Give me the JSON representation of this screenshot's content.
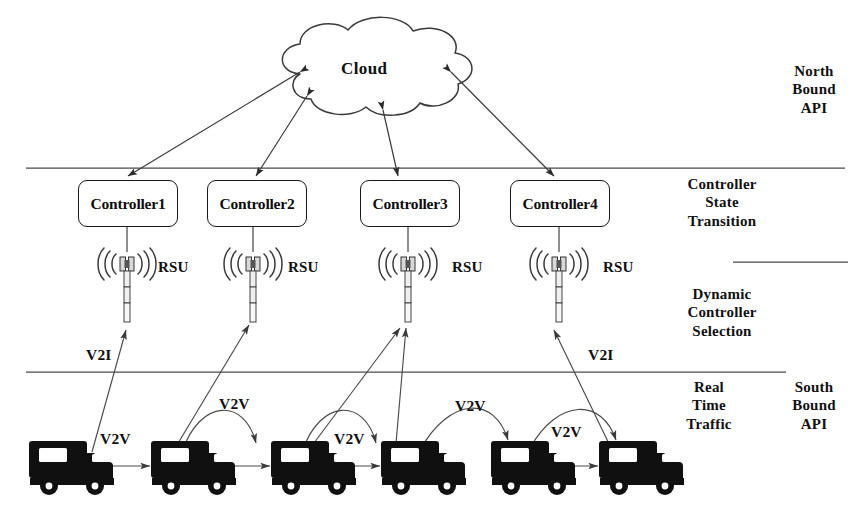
{
  "diagram": {
    "background": "#ffffff",
    "stroke": "#2b2b2b",
    "vehicle_fill": "#101010"
  },
  "cloud": {
    "label": "Cloud",
    "x": 367,
    "y": 69
  },
  "controllers": [
    {
      "label": "Controller1",
      "x": 78,
      "y": 180,
      "w": 98,
      "h": 45
    },
    {
      "label": "Controller2",
      "x": 207,
      "y": 180,
      "w": 98,
      "h": 45
    },
    {
      "label": "Controller3",
      "x": 360,
      "y": 180,
      "w": 98,
      "h": 45
    },
    {
      "label": "Controller4",
      "x": 510,
      "y": 180,
      "w": 98,
      "h": 45
    }
  ],
  "rsus": [
    {
      "label": "RSU",
      "tower_x": 127,
      "label_x": 158,
      "label_y": 258
    },
    {
      "label": "RSU",
      "tower_x": 253,
      "label_x": 288,
      "label_y": 258
    },
    {
      "label": "RSU",
      "tower_x": 408,
      "label_x": 452,
      "label_y": 258
    },
    {
      "label": "RSU",
      "tower_x": 559,
      "label_x": 603,
      "label_y": 258
    }
  ],
  "side_labels": [
    {
      "name": "north-bound-api",
      "text": "North\nBound\nAPI",
      "x": 776,
      "y": 62
    },
    {
      "name": "controller-state-transition",
      "text": "Controller\nState\nTransition",
      "x": 682,
      "y": 175
    },
    {
      "name": "dynamic-controller-selection",
      "text": "Dynamic\nController\nSelection",
      "x": 682,
      "y": 285
    },
    {
      "name": "real-time-traffic",
      "text": "Real\nTime\nTraffic",
      "x": 682,
      "y": 378
    },
    {
      "name": "south-bound-api",
      "text": "South\nBound\nAPI",
      "x": 783,
      "y": 378
    }
  ],
  "edge_labels": [
    {
      "name": "v2i-label-left",
      "text": "V2I",
      "x": 86,
      "y": 348
    },
    {
      "name": "v2i-label-right",
      "text": "V2I",
      "x": 588,
      "y": 348
    },
    {
      "name": "v2v-label-1",
      "text": "V2V",
      "x": 100,
      "y": 432
    },
    {
      "name": "v2v-label-2",
      "text": "V2V",
      "x": 219,
      "y": 397
    },
    {
      "name": "v2v-label-3",
      "text": "V2V",
      "x": 334,
      "y": 432
    },
    {
      "name": "v2v-label-4",
      "text": "V2V",
      "x": 455,
      "y": 399
    },
    {
      "name": "v2v-label-5",
      "text": "V2V",
      "x": 551,
      "y": 425
    }
  ],
  "dividers": [
    {
      "name": "divider-north-bound",
      "x1": 26,
      "y1": 168,
      "x2": 845,
      "y2": 168
    },
    {
      "name": "divider-mid-right",
      "x1": 733,
      "y1": 262,
      "x2": 848,
      "y2": 262
    },
    {
      "name": "divider-south-bound",
      "x1": 26,
      "y1": 372,
      "x2": 786,
      "y2": 372
    }
  ],
  "vehicles": [
    {
      "name": "vehicle-1",
      "x": 30,
      "y": 437
    },
    {
      "name": "vehicle-2",
      "x": 152,
      "y": 437
    },
    {
      "name": "vehicle-3",
      "x": 272,
      "y": 437
    },
    {
      "name": "vehicle-4",
      "x": 382,
      "y": 437
    },
    {
      "name": "vehicle-5",
      "x": 492,
      "y": 437
    },
    {
      "name": "vehicle-6",
      "x": 600,
      "y": 437
    }
  ],
  "connections": {
    "cloud_to_controllers": 4,
    "controller_to_rsu": 4,
    "v2i_links": 5,
    "v2v_links": 5
  }
}
